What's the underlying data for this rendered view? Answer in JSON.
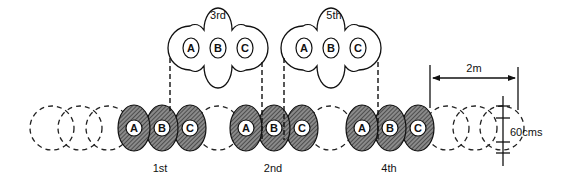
{
  "diagram": {
    "type": "crop-row sequence / pass layout",
    "units": [
      "A",
      "B",
      "C"
    ],
    "bottom_row": {
      "groups": [
        {
          "label": "1st",
          "units": [
            "A",
            "B",
            "C"
          ],
          "style": "shaded"
        },
        {
          "label": "2nd",
          "units": [
            "A",
            "B",
            "C"
          ],
          "style": "shaded"
        },
        {
          "label": "4th",
          "units": [
            "A",
            "B",
            "C"
          ],
          "style": "shaded"
        }
      ],
      "placeholder_circles": "dashed"
    },
    "top_row": {
      "groups": [
        {
          "label": "3rd",
          "units": [
            "A",
            "B",
            "C"
          ],
          "style": "open"
        },
        {
          "label": "5th",
          "units": [
            "A",
            "B",
            "C"
          ],
          "style": "open"
        }
      ]
    },
    "dimensions": {
      "width_label": "2m",
      "height_label": "60cms"
    }
  }
}
